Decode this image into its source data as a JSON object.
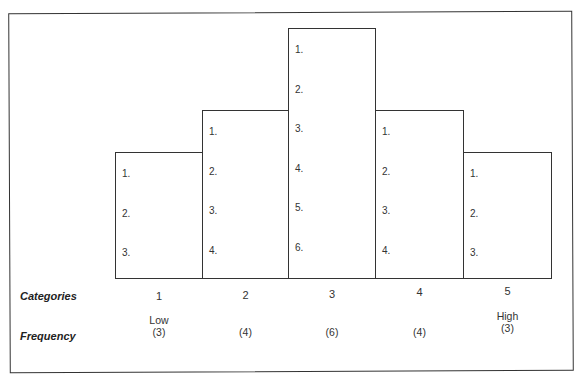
{
  "chart_data": {
    "type": "bar",
    "title": "",
    "xlabel": "Categories",
    "ylabel": "Frequency",
    "categories": [
      "1",
      "2",
      "3",
      "4",
      "5"
    ],
    "category_extremes": {
      "low": "Low",
      "high": "High"
    },
    "values": [
      3,
      4,
      6,
      4,
      3
    ],
    "ylim": [
      0,
      6
    ],
    "grid": false,
    "legend": null,
    "bar_items": [
      [
        "1.",
        "2.",
        "3."
      ],
      [
        "1.",
        "2.",
        "3.",
        "4."
      ],
      [
        "1.",
        "2.",
        "3.",
        "4.",
        "5.",
        "6."
      ],
      [
        "1.",
        "2.",
        "3.",
        "4."
      ],
      [
        "1.",
        "2.",
        "3."
      ]
    ]
  },
  "labels": {
    "categories_row": "Categories",
    "frequency_row": "Frequency"
  },
  "columns": [
    {
      "category": "1",
      "extreme": "Low",
      "frequency": "(3)"
    },
    {
      "category": "2",
      "extreme": "",
      "frequency": "(4)"
    },
    {
      "category": "3",
      "extreme": "",
      "frequency": "(6)"
    },
    {
      "category": "4",
      "extreme": "",
      "frequency": "(4)"
    },
    {
      "category": "5",
      "extreme": "High",
      "frequency": "(3)"
    }
  ]
}
